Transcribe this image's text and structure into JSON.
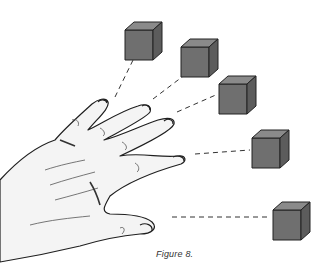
{
  "figure": {
    "caption": "Figure 8.",
    "colors": {
      "cube_front": "#6f6f6f",
      "cube_top": "#8a8a8a",
      "cube_side": "#5c5c5c",
      "outline": "#222222",
      "skin": "#f4f4f4"
    },
    "cubes": [
      {
        "finger": "pinky",
        "count": 1
      },
      {
        "finger": "ring",
        "count": 1
      },
      {
        "finger": "middle",
        "count": 1
      },
      {
        "finger": "index",
        "count": 1
      },
      {
        "finger": "thumb",
        "count": 1
      }
    ]
  }
}
